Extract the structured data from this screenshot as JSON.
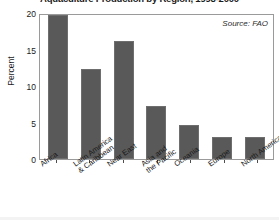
{
  "chart_data": {
    "type": "bar",
    "title": "Aquaculture Production by Region, 1998-2000",
    "xlabel": "",
    "ylabel": "Percent",
    "ylim": [
      0,
      20
    ],
    "yticks": [
      0,
      5,
      10,
      15,
      20
    ],
    "ytick_labels": [
      "0",
      "5",
      "10",
      "15",
      "20"
    ],
    "grid": false,
    "legend": false,
    "source_note": "Source: FAO",
    "bar_color": "#595959",
    "categories": [
      "Africa",
      "Latin America & Caribbean",
      "Near East",
      "Asia and the Pacific",
      "Oceania",
      "Europe",
      "North America"
    ],
    "category_lines": [
      [
        "Africa",
        ""
      ],
      [
        "Latin America",
        "& Caribbean"
      ],
      [
        "Near East",
        ""
      ],
      [
        "Asia and",
        "the Pacific"
      ],
      [
        "Oceania",
        ""
      ],
      [
        "Europe",
        ""
      ],
      [
        "North America",
        ""
      ]
    ],
    "values": [
      19.7,
      12.3,
      16.2,
      7.3,
      4.7,
      3.0,
      3.0
    ]
  }
}
